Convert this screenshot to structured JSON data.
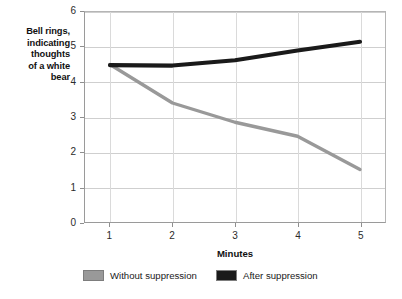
{
  "chart_data": {
    "type": "line",
    "title": "",
    "xlabel": "Minutes",
    "ylabel": "Bell rings, indicating thoughts of a white bear",
    "ylabel_lines": [
      "Bell rings,",
      "indicating",
      "thoughts",
      "of a white",
      "bear"
    ],
    "x": [
      1,
      2,
      3,
      4,
      5
    ],
    "xtick_labels": [
      "1",
      "2",
      "3",
      "4",
      "5"
    ],
    "ytick_labels": [
      "0",
      "1",
      "2",
      "3",
      "4",
      "5",
      "6"
    ],
    "yticks": [
      0,
      1,
      2,
      3,
      4,
      5,
      6
    ],
    "xlim": [
      0.6,
      5.4
    ],
    "ylim": [
      0,
      6
    ],
    "grid": "horizontal-and-vertical",
    "legend_position": "bottom",
    "series": [
      {
        "name": "Without suppression",
        "color": "#999999",
        "values": [
          4.5,
          3.4,
          2.85,
          2.45,
          1.5
        ]
      },
      {
        "name": "After suppression",
        "color": "#1a1a1a",
        "values": [
          4.48,
          4.47,
          4.62,
          4.9,
          5.15
        ]
      }
    ]
  },
  "legend": {
    "items": [
      {
        "label": "Without suppression",
        "color": "#999999"
      },
      {
        "label": "After suppression",
        "color": "#1a1a1a"
      }
    ]
  },
  "axes": {
    "x_title": "Minutes"
  }
}
